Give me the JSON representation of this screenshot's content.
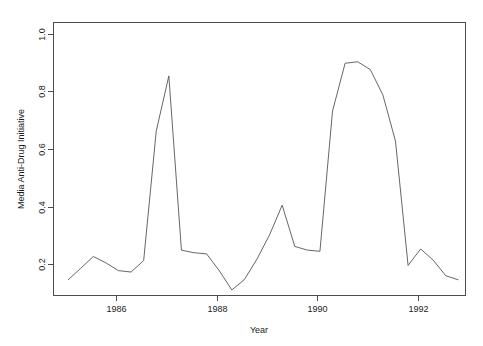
{
  "chart_data": {
    "type": "line",
    "title": "",
    "xlabel": "Year",
    "ylabel": "Media Anti-Drug Initiative",
    "xlim": [
      1984.75,
      1992.95
    ],
    "ylim": [
      0.09,
      1.04
    ],
    "xticks": [
      1986,
      1988,
      1990,
      1992
    ],
    "xticklabels": [
      "1986",
      "1988",
      "1990",
      "1992"
    ],
    "yticks": [
      0.2,
      0.4,
      0.6,
      0.8,
      1.0
    ],
    "yticklabels": [
      "0.2",
      "0.4",
      "0.6",
      "0.8",
      "1.0"
    ],
    "grid": false,
    "legend": false,
    "line_color": "#555555",
    "axis_color": "#4d4d4d",
    "background_color": "#ffffff",
    "series": [
      {
        "name": "Media Anti-Drug Initiative",
        "x": [
          1985.05,
          1985.3,
          1985.55,
          1985.8,
          1986.05,
          1986.3,
          1986.55,
          1986.8,
          1987.05,
          1987.3,
          1987.55,
          1987.8,
          1988.05,
          1988.3,
          1988.55,
          1988.8,
          1989.05,
          1989.3,
          1989.55,
          1989.8,
          1990.05,
          1990.3,
          1990.55,
          1990.8,
          1991.05,
          1991.3,
          1991.55,
          1991.8,
          1992.05,
          1992.3,
          1992.55,
          1992.8
        ],
        "values": [
          0.146,
          0.186,
          0.227,
          0.205,
          0.178,
          0.173,
          0.213,
          0.662,
          0.853,
          0.249,
          0.24,
          0.236,
          0.178,
          0.111,
          0.147,
          0.218,
          0.302,
          0.405,
          0.262,
          0.249,
          0.245,
          0.731,
          0.897,
          0.902,
          0.875,
          0.787,
          0.627,
          0.196,
          0.253,
          0.214,
          0.16,
          0.146
        ]
      }
    ]
  },
  "plot_box": {
    "left": 53,
    "top": 22,
    "right": 466,
    "bottom": 296
  }
}
